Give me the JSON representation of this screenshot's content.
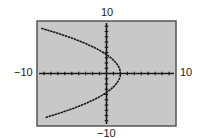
{
  "labels": {
    "ymax": "10",
    "ymin": "−10",
    "xmin": "−10",
    "xmax": "10"
  },
  "colors": {
    "screen": "#c8c8c8",
    "frame": "#555555",
    "curve": "#1a1a1a"
  },
  "chart_data": {
    "type": "line",
    "title": "",
    "xlabel": "",
    "ylabel": "",
    "xlim": [
      -10,
      10
    ],
    "ylim": [
      -10,
      10
    ],
    "xscl": 1,
    "yscl": 1,
    "grid": false,
    "legend": null,
    "tick_labels": {
      "x": [
        "-10",
        "10"
      ],
      "y": [
        "-10",
        "10"
      ]
    },
    "series": [
      {
        "name": "parabola",
        "x": [
          -9.5,
          -7,
          -4.5,
          -2,
          0,
          1.5,
          2,
          1.5,
          0,
          -2,
          -4.5,
          -7,
          -9.5
        ],
        "y": [
          8.4,
          7.3,
          5.6,
          4.5,
          2.2,
          1.0,
          0,
          -1.0,
          -2.2,
          -4.5,
          -5.6,
          -7.3,
          -8.4
        ]
      }
    ]
  }
}
